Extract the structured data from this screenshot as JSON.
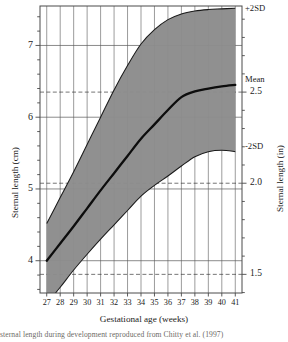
{
  "chart_data": {
    "type": "line",
    "title": "",
    "xlabel": "Gestational age (weeks)",
    "ylabel": "Sternal length (cm)",
    "ylabel_right": "Sternal length (in)",
    "xlim": [
      26.5,
      41.5
    ],
    "ylim": [
      3.55,
      7.55
    ],
    "ylim_right": [
      1.398,
      2.972
    ],
    "grid": true,
    "grid_vertical": "every week",
    "grid_horizontal_cm": [
      4,
      5,
      6,
      7
    ],
    "grid_horizontal_in_dashed": [
      1.5,
      2.0,
      2.5
    ],
    "legend_position": "inline-right",
    "x": [
      27,
      28,
      29,
      30,
      31,
      32,
      33,
      34,
      35,
      36,
      37,
      38,
      39,
      40,
      41
    ],
    "xticklabels": [
      "27",
      "28",
      "29",
      "30",
      "31",
      "32",
      "33",
      "34",
      "35",
      "36",
      "37",
      "38",
      "39",
      "40",
      "41"
    ],
    "yticklabels_left": [
      "4",
      "5",
      "6",
      "7"
    ],
    "yticklabels_right": [
      "1.5",
      "2.0",
      "2.5"
    ],
    "band_fill_color": "#8c8c8c",
    "line_color": "#111111",
    "series": [
      {
        "name": "+2SD",
        "label": "+2SD",
        "values": [
          4.52,
          4.88,
          5.24,
          5.62,
          6.0,
          6.38,
          6.72,
          7.02,
          7.22,
          7.36,
          7.44,
          7.48,
          7.5,
          7.51,
          7.52
        ]
      },
      {
        "name": "Mean",
        "label": "Mean",
        "values": [
          4.0,
          4.24,
          4.48,
          4.73,
          4.98,
          5.22,
          5.46,
          5.7,
          5.9,
          6.1,
          6.28,
          6.36,
          6.4,
          6.43,
          6.45
        ]
      },
      {
        "name": "-2SD",
        "label": "-2SD",
        "values": [
          3.4,
          3.63,
          3.87,
          4.09,
          4.3,
          4.5,
          4.7,
          4.9,
          5.05,
          5.18,
          5.32,
          5.45,
          5.52,
          5.54,
          5.52
        ]
      }
    ]
  },
  "axes": {
    "left_title": "Sternal length (cm)",
    "right_title": "Sternal length (in)",
    "bottom_title": "Gestational age (weeks)"
  },
  "annotations": {
    "plus2sd": "+2SD",
    "mean": "Mean",
    "minus2sd": "-2SD"
  },
  "caption": {
    "text": "sternal length during development reproduced from Chitty et al. (1997)"
  }
}
